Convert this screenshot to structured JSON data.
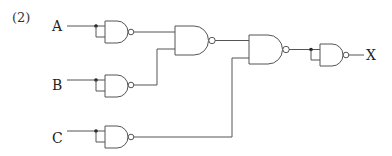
{
  "diagram": {
    "problem_label": "(2)",
    "inputs": [
      {
        "name": "A"
      },
      {
        "name": "B"
      },
      {
        "name": "C"
      }
    ],
    "output": {
      "name": "X"
    },
    "gates": [
      {
        "id": "nand-a",
        "type": "NAND",
        "inputs": [
          "A",
          "A"
        ]
      },
      {
        "id": "nand-b",
        "type": "NAND",
        "inputs": [
          "B",
          "B"
        ]
      },
      {
        "id": "nand-c",
        "type": "NAND",
        "inputs": [
          "C",
          "C"
        ]
      },
      {
        "id": "nand-ab",
        "type": "NAND",
        "inputs": [
          "nand-a",
          "nand-b"
        ]
      },
      {
        "id": "nand-abc",
        "type": "NAND",
        "inputs": [
          "nand-ab",
          "nand-c"
        ]
      },
      {
        "id": "nand-out",
        "type": "NAND",
        "inputs": [
          "nand-abc",
          "nand-abc"
        ]
      }
    ],
    "colors": {
      "line": "#555555",
      "text": "#222222",
      "background": "#ffffff"
    }
  }
}
